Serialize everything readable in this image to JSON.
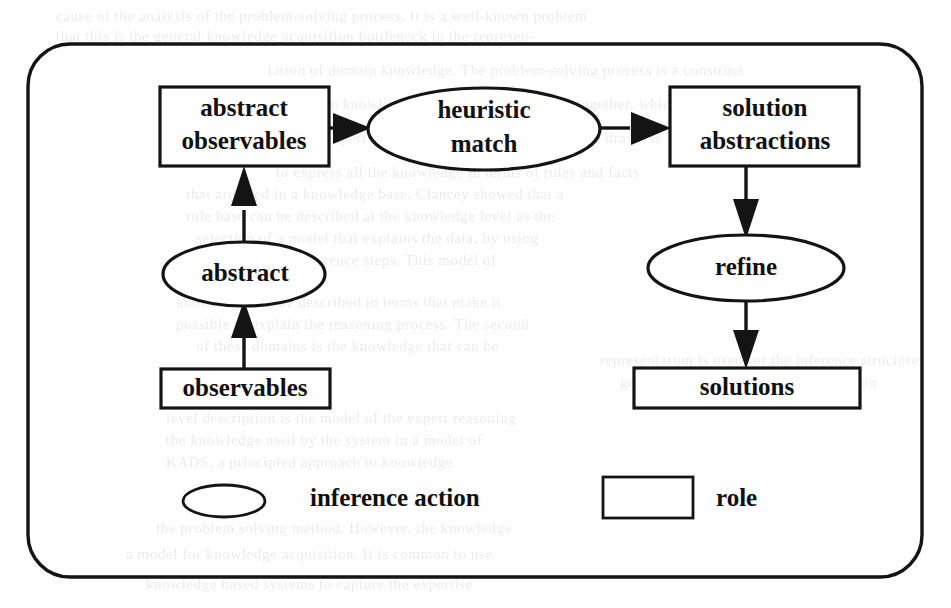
{
  "figure": {
    "canvas": {
      "width": 951,
      "height": 608
    },
    "border": {
      "shape": "rounded-rectangle",
      "x": 28,
      "y": 44,
      "width": 894,
      "height": 533,
      "radius": 42
    },
    "colors": {
      "ink": "#141414",
      "paper": "#ffffff",
      "text": "#101010"
    },
    "roles": [
      {
        "id": "abstract-observables",
        "label_line1": "abstract",
        "label_line2": "observables",
        "shape": "rectangle",
        "x": 160,
        "y": 87,
        "width": 169,
        "height": 79
      },
      {
        "id": "solution-abstractions",
        "label_line1": "solution",
        "label_line2": "abstractions",
        "shape": "rectangle",
        "x": 670,
        "y": 87,
        "width": 189,
        "height": 79
      },
      {
        "id": "observables",
        "label_line1": "observables",
        "label_line2": "",
        "shape": "rectangle",
        "x": 161,
        "y": 369,
        "width": 169,
        "height": 39
      },
      {
        "id": "solutions",
        "label_line1": "solutions",
        "label_line2": "",
        "shape": "rectangle",
        "x": 634,
        "y": 368,
        "width": 226,
        "height": 40
      }
    ],
    "inference_actions": [
      {
        "id": "heuristic-match",
        "label_line1": "heuristic",
        "label_line2": "match",
        "shape": "ellipse",
        "cx": 484,
        "cy": 129,
        "rx": 116,
        "ry": 41
      },
      {
        "id": "abstract",
        "label_line1": "abstract",
        "label_line2": "",
        "shape": "ellipse",
        "cx": 244,
        "cy": 274,
        "rx": 81,
        "ry": 32
      },
      {
        "id": "refine",
        "label_line1": "refine",
        "label_line2": "",
        "shape": "ellipse",
        "cx": 746,
        "cy": 268,
        "rx": 98,
        "ry": 33
      }
    ],
    "edges": [
      {
        "id": "observables-to-abstract",
        "from": "observables",
        "to": "abstract",
        "direction": "up"
      },
      {
        "id": "abstract-to-abstract-observables",
        "from": "abstract",
        "to": "abstract-observables",
        "direction": "up"
      },
      {
        "id": "abstract-observables-to-heuristic-match",
        "from": "abstract-observables",
        "to": "heuristic-match",
        "direction": "right"
      },
      {
        "id": "heuristic-match-to-solution-abstractions",
        "from": "heuristic-match",
        "to": "solution-abstractions",
        "direction": "right"
      },
      {
        "id": "solution-abstractions-to-refine",
        "from": "solution-abstractions",
        "to": "refine",
        "direction": "down"
      },
      {
        "id": "refine-to-solutions",
        "from": "refine",
        "to": "solutions",
        "direction": "down"
      }
    ],
    "legend": {
      "items": [
        {
          "id": "legend-inference-action",
          "label": "inference action",
          "symbol": "ellipse",
          "cx": 224,
          "cy": 501,
          "rx": 41,
          "ry": 16,
          "text_x": 310,
          "text_y": 500
        },
        {
          "id": "legend-role",
          "label": "role",
          "symbol": "rectangle",
          "x": 603,
          "y": 477,
          "width": 90,
          "height": 41,
          "text_x": 716,
          "text_y": 500
        }
      ]
    }
  },
  "background_text": {
    "lines": [
      {
        "text": "cause of the analysis of the problem-solving process. It is a well-known problem",
        "x": 56,
        "y": 8
      },
      {
        "text": "that this is the general knowledge acquisition bottleneck in the represen-",
        "x": 56,
        "y": 28
      },
      {
        "text": "tation of domain knowledge. The problem-solving process is a construct",
        "x": 268,
        "y": 62
      },
      {
        "text": "of the knowledge engineer and the expert together, which",
        "x": 300,
        "y": 96
      },
      {
        "text": "of an expert system. The conclusion that can be drawn is",
        "x": 288,
        "y": 130
      },
      {
        "text": "to express all the knowledge in terms of rules and facts",
        "x": 276,
        "y": 164
      },
      {
        "text": "that are used in a knowledge base. Clancey showed that a",
        "x": 186,
        "y": 186
      },
      {
        "text": "rule base can be described at the knowledge level as the",
        "x": 186,
        "y": 208
      },
      {
        "text": "selection of a model that explains the data, by using",
        "x": 196,
        "y": 230
      },
      {
        "text": "a structure of inference steps. This model of",
        "x": 206,
        "y": 252
      },
      {
        "text": "knowledge can be described in terms that make it",
        "x": 176,
        "y": 294
      },
      {
        "text": "possible to explain the reasoning process. The second",
        "x": 176,
        "y": 316
      },
      {
        "text": "of these domains is the knowledge that can be",
        "x": 196,
        "y": 338
      },
      {
        "text": "level description is the model of the expert reasoning",
        "x": 166,
        "y": 410
      },
      {
        "text": "the knowledge used by the system in a model of",
        "x": 166,
        "y": 432
      },
      {
        "text": "KADS, a principled approach to knowledge",
        "x": 166,
        "y": 454
      },
      {
        "text": "the problem solving method. However, the knowledge",
        "x": 156,
        "y": 520
      },
      {
        "text": "a model for knowledge acquisition. It is common to use",
        "x": 126,
        "y": 546
      },
      {
        "text": "knowledge based systems to capture the expertise",
        "x": 146,
        "y": 576
      },
      {
        "text": "representation is used for the inference structure",
        "x": 600,
        "y": 352
      },
      {
        "text": "generic task and the role of the domain",
        "x": 620,
        "y": 374
      }
    ]
  }
}
